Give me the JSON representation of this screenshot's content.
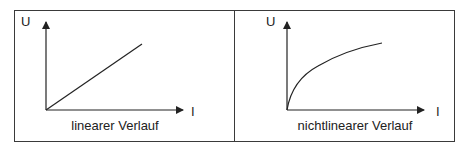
{
  "panels": [
    {
      "y_axis_label": "U",
      "x_axis_label": "I",
      "caption": "linearer Verlauf",
      "curve_type": "linear"
    },
    {
      "y_axis_label": "U",
      "x_axis_label": "I",
      "caption": "nichtlinearer Verlauf",
      "curve_type": "nonlinear (concave, saturating)"
    }
  ],
  "colors": {
    "line": "#222222",
    "border": "#3a3a3a",
    "background": "#ffffff"
  }
}
